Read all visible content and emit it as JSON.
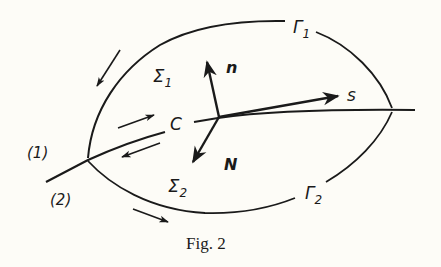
{
  "figure": {
    "caption": "Fig. 2",
    "labels": {
      "gamma1": "Γ",
      "gamma1_sub": "1",
      "gamma2": "Γ",
      "gamma2_sub": "2",
      "sigma1": "Σ",
      "sigma1_sub": "1",
      "sigma2": "Σ",
      "sigma2_sub": "2",
      "curve_c": "C",
      "vec_n": "n",
      "vec_s": "s",
      "vec_N": "N",
      "branch1": "(1)",
      "branch2": "(2)"
    },
    "colors": {
      "ink": "#1a1a1a",
      "paper": "#fdfcf7"
    }
  }
}
